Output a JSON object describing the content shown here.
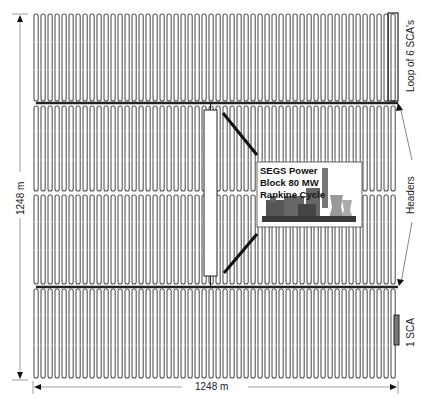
{
  "diagram": {
    "field": {
      "x_min": 33,
      "x_max": 398,
      "y_min": 14,
      "y_max": 378,
      "loop_pitch_px": 7,
      "loop_color": "#555555",
      "header_color": "#222222",
      "upper_header_y": 103,
      "lower_header_y": 287,
      "mid_gap_y": 193
    },
    "labels": {
      "height_dimension": "1248 m",
      "width_dimension": "1248 m",
      "loop_label": "Loop of 6 SCA's",
      "headers_label": "Headers",
      "sca_label": "1 SCA"
    },
    "power_block": {
      "line1": "SEGS Power",
      "line2": "Block 80 MW",
      "line3": "Rankine Cycle",
      "icon": "power-plant-icon"
    }
  }
}
